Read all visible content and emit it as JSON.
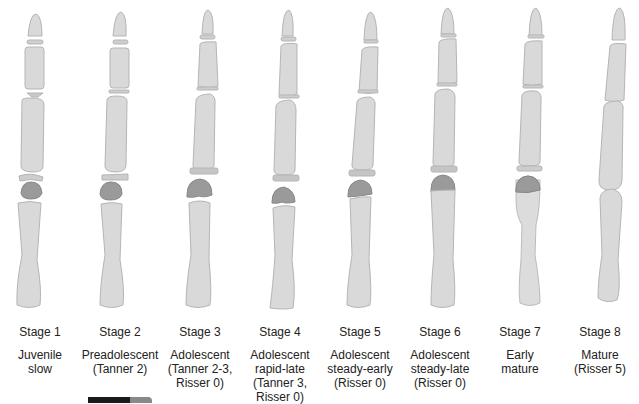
{
  "figure": {
    "colors": {
      "bone_fill": "#d9d9d9",
      "bone_edge": "#b5b5b5",
      "epiphysis_fill": "#9a9a9a",
      "text": "#222222"
    },
    "stages": [
      {
        "stage": "Stage 1",
        "description": "Juvenile\nslow"
      },
      {
        "stage": "Stage 2",
        "description": "Preadolescent\n(Tanner 2)"
      },
      {
        "stage": "Stage 3",
        "description": "Adolescent\n(Tanner 2-3,\nRisser 0)"
      },
      {
        "stage": "Stage 4",
        "description": "Adolescent\nrapid-late\n(Tanner 3,\nRisser 0)"
      },
      {
        "stage": "Stage 5",
        "description": "Adolescent\nsteady-early\n(Risser 0)"
      },
      {
        "stage": "Stage 6",
        "description": "Adolescent\nsteady-late\n(Risser 0)"
      },
      {
        "stage": "Stage 7",
        "description": "Early\nmature"
      },
      {
        "stage": "Stage 8",
        "description": "Mature\n(Risser 5)"
      }
    ]
  }
}
